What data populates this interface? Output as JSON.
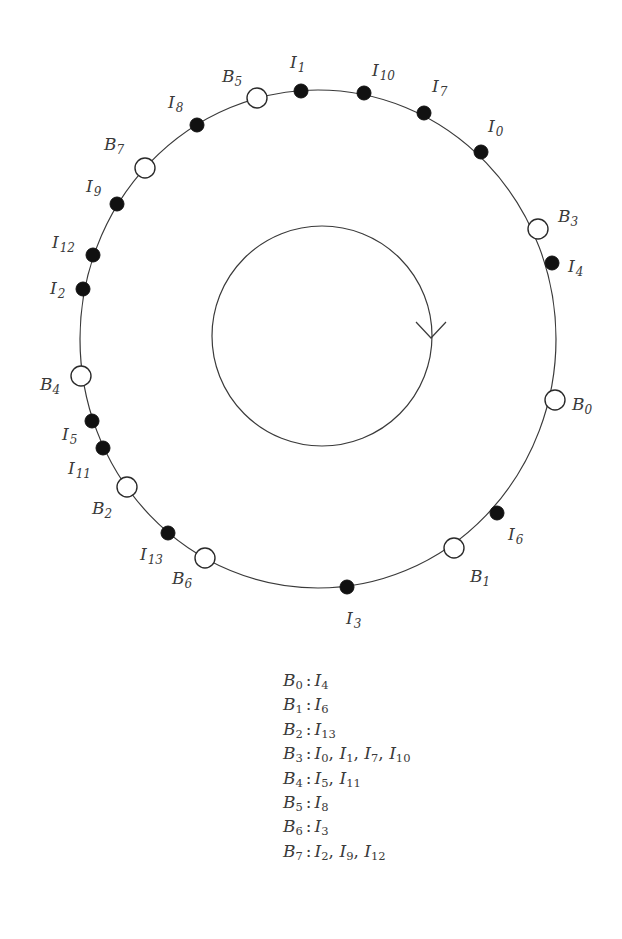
{
  "diagram": {
    "outer_circle": {
      "cx": 318,
      "cy": 339,
      "rx": 238,
      "ry": 249
    },
    "inner_circle": {
      "cx": 322,
      "cy": 336,
      "r": 110,
      "direction": "clockwise",
      "arrow_at": {
        "x": 431,
        "y": 338
      }
    },
    "colors": {
      "stroke": "#3a3a3a",
      "filled_node": "#111111",
      "hollow_node": "#ffffff"
    },
    "nodes": [
      {
        "id": "B0",
        "kind": "hollow",
        "x": 555,
        "y": 400,
        "label": {
          "base": "B",
          "sub": "0",
          "x": 572,
          "y": 410
        }
      },
      {
        "id": "B1",
        "kind": "hollow",
        "x": 454,
        "y": 548,
        "label": {
          "base": "B",
          "sub": "1",
          "x": 470,
          "y": 582
        }
      },
      {
        "id": "B2",
        "kind": "hollow",
        "x": 127,
        "y": 487,
        "label": {
          "base": "B",
          "sub": "2",
          "x": 92,
          "y": 514
        }
      },
      {
        "id": "B3",
        "kind": "hollow",
        "x": 538,
        "y": 229,
        "label": {
          "base": "B",
          "sub": "3",
          "x": 558,
          "y": 222
        }
      },
      {
        "id": "B4",
        "kind": "hollow",
        "x": 81,
        "y": 376,
        "label": {
          "base": "B",
          "sub": "4",
          "x": 40,
          "y": 390
        }
      },
      {
        "id": "B5",
        "kind": "hollow",
        "x": 257,
        "y": 98,
        "label": {
          "base": "B",
          "sub": "5",
          "x": 222,
          "y": 82
        }
      },
      {
        "id": "B6",
        "kind": "hollow",
        "x": 205,
        "y": 558,
        "label": {
          "base": "B",
          "sub": "6",
          "x": 172,
          "y": 584
        }
      },
      {
        "id": "B7",
        "kind": "hollow",
        "x": 145,
        "y": 168,
        "label": {
          "base": "B",
          "sub": "7",
          "x": 104,
          "y": 150
        }
      },
      {
        "id": "I0",
        "kind": "filled",
        "x": 481,
        "y": 152,
        "label": {
          "base": "I",
          "sub": "0",
          "x": 488,
          "y": 132
        }
      },
      {
        "id": "I1",
        "kind": "filled",
        "x": 301,
        "y": 91,
        "label": {
          "base": "I",
          "sub": "1",
          "x": 290,
          "y": 68
        }
      },
      {
        "id": "I2",
        "kind": "filled",
        "x": 83,
        "y": 289,
        "label": {
          "base": "I",
          "sub": "2",
          "x": 50,
          "y": 294
        }
      },
      {
        "id": "I3",
        "kind": "filled",
        "x": 347,
        "y": 587,
        "label": {
          "base": "I",
          "sub": "3",
          "x": 346,
          "y": 624
        }
      },
      {
        "id": "I4",
        "kind": "filled",
        "x": 552,
        "y": 263,
        "label": {
          "base": "I",
          "sub": "4",
          "x": 568,
          "y": 272
        }
      },
      {
        "id": "I5",
        "kind": "filled",
        "x": 92,
        "y": 421,
        "label": {
          "base": "I",
          "sub": "5",
          "x": 62,
          "y": 440
        }
      },
      {
        "id": "I6",
        "kind": "filled",
        "x": 497,
        "y": 513,
        "label": {
          "base": "I",
          "sub": "6",
          "x": 508,
          "y": 540
        }
      },
      {
        "id": "I7",
        "kind": "filled",
        "x": 424,
        "y": 113,
        "label": {
          "base": "I",
          "sub": "7",
          "x": 432,
          "y": 92
        }
      },
      {
        "id": "I8",
        "kind": "filled",
        "x": 197,
        "y": 125,
        "label": {
          "base": "I",
          "sub": "8",
          "x": 168,
          "y": 108
        }
      },
      {
        "id": "I9",
        "kind": "filled",
        "x": 117,
        "y": 204,
        "label": {
          "base": "I",
          "sub": "9",
          "x": 86,
          "y": 192
        }
      },
      {
        "id": "I10",
        "kind": "filled",
        "x": 364,
        "y": 93,
        "label": {
          "base": "I",
          "sub": "10",
          "x": 372,
          "y": 76
        }
      },
      {
        "id": "I11",
        "kind": "filled",
        "x": 103,
        "y": 448,
        "label": {
          "base": "I",
          "sub": "11",
          "x": 68,
          "y": 474
        }
      },
      {
        "id": "I12",
        "kind": "filled",
        "x": 93,
        "y": 255,
        "label": {
          "base": "I",
          "sub": "12",
          "x": 52,
          "y": 248
        }
      },
      {
        "id": "I13",
        "kind": "filled",
        "x": 168,
        "y": 533,
        "label": {
          "base": "I",
          "sub": "13",
          "x": 140,
          "y": 560
        }
      }
    ]
  },
  "legend": {
    "rows": [
      {
        "key": {
          "base": "B",
          "sub": "0"
        },
        "values": [
          {
            "base": "I",
            "sub": "4"
          }
        ]
      },
      {
        "key": {
          "base": "B",
          "sub": "1"
        },
        "values": [
          {
            "base": "I",
            "sub": "6"
          }
        ]
      },
      {
        "key": {
          "base": "B",
          "sub": "2"
        },
        "values": [
          {
            "base": "I",
            "sub": "13"
          }
        ]
      },
      {
        "key": {
          "base": "B",
          "sub": "3"
        },
        "values": [
          {
            "base": "I",
            "sub": "0"
          },
          {
            "base": "I",
            "sub": "1"
          },
          {
            "base": "I",
            "sub": "7"
          },
          {
            "base": "I",
            "sub": "10"
          }
        ]
      },
      {
        "key": {
          "base": "B",
          "sub": "4"
        },
        "values": [
          {
            "base": "I",
            "sub": "5"
          },
          {
            "base": "I",
            "sub": "11"
          }
        ]
      },
      {
        "key": {
          "base": "B",
          "sub": "5"
        },
        "values": [
          {
            "base": "I",
            "sub": "8"
          }
        ]
      },
      {
        "key": {
          "base": "B",
          "sub": "6"
        },
        "values": [
          {
            "base": "I",
            "sub": "3"
          }
        ]
      },
      {
        "key": {
          "base": "B",
          "sub": "7"
        },
        "values": [
          {
            "base": "I",
            "sub": "2"
          },
          {
            "base": "I",
            "sub": "9"
          },
          {
            "base": "I",
            "sub": "12"
          }
        ]
      }
    ],
    "separator": ":",
    "list_separator": ","
  }
}
